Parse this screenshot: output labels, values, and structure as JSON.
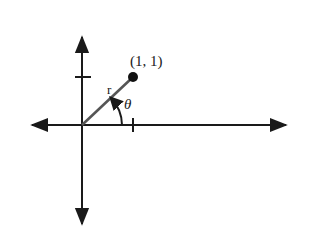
{
  "diagram": {
    "type": "polar-coordinate-figure",
    "point_label": "(1, 1)",
    "radius_label": "r",
    "angle_label": "θ",
    "point": {
      "x": 1,
      "y": 1
    },
    "origin": {
      "x": 0,
      "y": 0
    },
    "ticks": {
      "x_axis": [
        1
      ],
      "y_axis": [
        1
      ]
    },
    "colors": {
      "axes": "#1a1a1a",
      "segment": "#555555",
      "point": "#111111"
    }
  }
}
